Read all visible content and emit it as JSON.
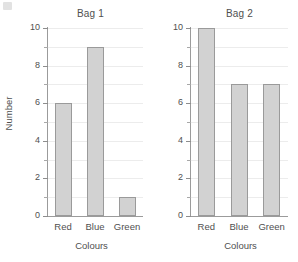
{
  "chart_data": [
    {
      "type": "bar",
      "title": "Bag 1",
      "categories": [
        "Red",
        "Blue",
        "Green"
      ],
      "values": [
        6,
        9,
        1
      ],
      "xlabel": "Colours",
      "ylabel": "Number",
      "ylim": [
        0,
        10
      ],
      "ytick_labels": [
        "0",
        "2",
        "4",
        "6",
        "8",
        "10"
      ],
      "ytick_values": [
        0,
        2,
        4,
        6,
        8,
        10
      ],
      "yminor_values": [
        1,
        3,
        5,
        7,
        9
      ],
      "grid": true,
      "legend": "none",
      "bar_fill": "#d2d2d2",
      "bar_stroke": "#9a9a9a"
    },
    {
      "type": "bar",
      "title": "Bag 2",
      "categories": [
        "Red",
        "Blue",
        "Green"
      ],
      "values": [
        10,
        7,
        7
      ],
      "xlabel": "Colours",
      "ylabel": "",
      "ylim": [
        0,
        10
      ],
      "ytick_labels": [
        "0",
        "2",
        "4",
        "6",
        "8",
        "10"
      ],
      "ytick_values": [
        0,
        2,
        4,
        6,
        8,
        10
      ],
      "yminor_values": [
        1,
        3,
        5,
        7,
        9
      ],
      "grid": true,
      "legend": "none",
      "bar_fill": "#d2d2d2",
      "bar_stroke": "#9a9a9a"
    }
  ]
}
